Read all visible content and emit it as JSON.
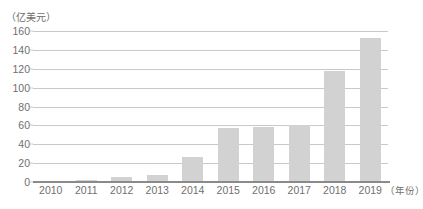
{
  "chart_data": {
    "type": "bar",
    "title": "",
    "subtitle": "",
    "xlabel": "（年份）",
    "ylabel": "（亿美元）",
    "categories": [
      "2010",
      "2011",
      "2012",
      "2013",
      "2014",
      "2015",
      "2016",
      "2017",
      "2018",
      "2019"
    ],
    "values": [
      1,
      2,
      5,
      7,
      27,
      57,
      58,
      60,
      118,
      153
    ],
    "series": [
      {
        "name": "",
        "values": [
          1,
          2,
          5,
          7,
          27,
          57,
          58,
          60,
          118,
          153
        ]
      }
    ],
    "ylim": [
      0,
      160
    ],
    "y_ticks": [
      0,
      20,
      40,
      60,
      80,
      100,
      120,
      140,
      160
    ],
    "y_tick_labels": [
      "0",
      "20",
      "40",
      "60",
      "80",
      "100",
      "120",
      "140",
      "160"
    ],
    "grid": true,
    "legend": false,
    "legend_position": "none",
    "bar_color": "#d2d2d2",
    "gridline_color": "#c9c9c9",
    "axis_color": "#8a8a8a",
    "text_color": "#6f6f6f"
  }
}
